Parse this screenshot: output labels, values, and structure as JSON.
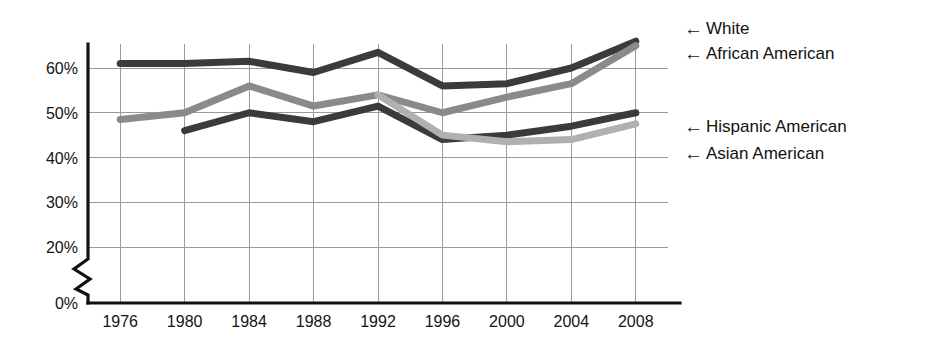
{
  "chart_data": {
    "type": "line",
    "title": "",
    "subtitle": "",
    "xlabel": "",
    "ylabel": "",
    "categories": [
      "1976",
      "1980",
      "1984",
      "1988",
      "1992",
      "1996",
      "2000",
      "2004",
      "2008"
    ],
    "x": [
      1976,
      1980,
      1984,
      1988,
      1992,
      1996,
      2000,
      2004,
      2008
    ],
    "ylim": [
      0,
      68
    ],
    "y_ticks": [
      "0%",
      "20%",
      "30%",
      "40%",
      "50%",
      "60%"
    ],
    "y_tick_values": [
      0,
      20,
      30,
      40,
      50,
      60
    ],
    "axis_break": true,
    "axis_break_between": [
      0,
      20
    ],
    "grid": true,
    "legend_position": "right-inline-arrows",
    "series": [
      {
        "name": "White",
        "color": "#3b3b3b",
        "values": [
          61.0,
          61.0,
          61.5,
          59.0,
          63.5,
          56.0,
          56.5,
          60.0,
          66.0
        ]
      },
      {
        "name": "African American",
        "color": "#8a8a8a",
        "values": [
          48.5,
          50.0,
          56.0,
          51.5,
          54.0,
          50.0,
          53.5,
          56.5,
          65.0
        ]
      },
      {
        "name": "Hispanic American",
        "color": "#3b3b3b",
        "values": [
          null,
          46.0,
          50.0,
          48.0,
          51.5,
          44.0,
          45.0,
          47.0,
          50.0
        ]
      },
      {
        "name": "Asian American",
        "color": "#b0b0b0",
        "values": [
          null,
          null,
          null,
          null,
          54.0,
          45.0,
          43.5,
          44.0,
          47.5
        ]
      }
    ]
  },
  "legend": {
    "arrow_glyph": "←",
    "entries": [
      {
        "label": "White",
        "series_index": 0
      },
      {
        "label": "African American",
        "series_index": 1
      },
      {
        "label": "Hispanic American",
        "series_index": 2
      },
      {
        "label": "Asian American",
        "series_index": 3
      }
    ]
  },
  "colors": {
    "grid": "#9a9a9a",
    "axis": "#111111",
    "text": "#141414",
    "background": "#ffffff",
    "series_dark": "#3b3b3b",
    "series_medium": "#8a8a8a",
    "series_light": "#b0b0b0"
  }
}
